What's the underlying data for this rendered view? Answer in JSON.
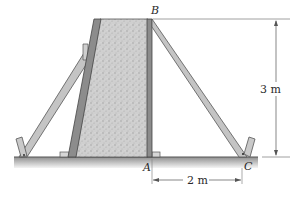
{
  "figure": {
    "type": "engineering-statics-diagram"
  },
  "labels": {
    "point_b": "B",
    "point_a": "A",
    "point_c": "C"
  },
  "dimensions": {
    "height": "3 m",
    "horizontal": "2 m"
  },
  "colors": {
    "concrete_fill": "#c9c9c9",
    "form_panel": "#8c8c8c",
    "strut_fill": "#c4c4c4",
    "strut_outline": "#555555",
    "ground_top": "#9a9a9a",
    "ground_bottom": "#f2f2f2",
    "dimension_line": "#555555"
  }
}
